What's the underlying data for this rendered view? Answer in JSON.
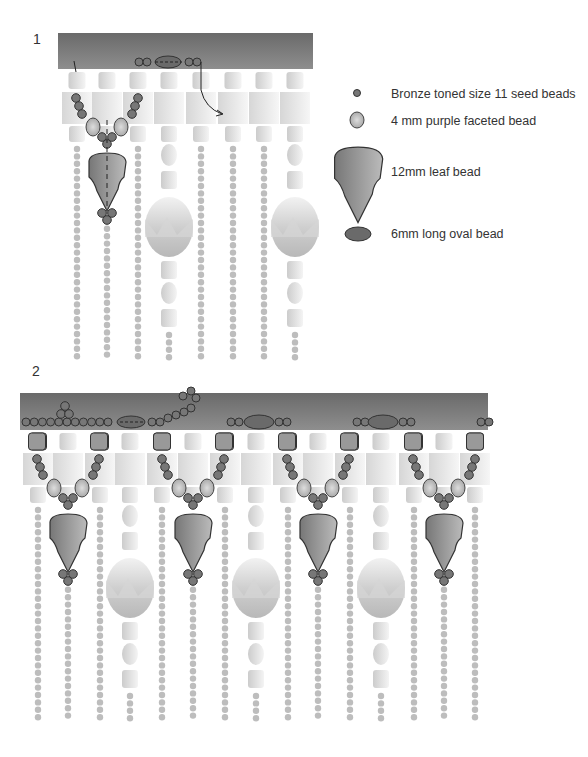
{
  "steps": [
    {
      "number": "1"
    },
    {
      "number": "2"
    }
  ],
  "legend": [
    {
      "icon": "seed-bead-icon",
      "label": "Bronze toned size 11 seed beads"
    },
    {
      "icon": "faceted-bead-icon",
      "label": "4 mm purple faceted bead"
    },
    {
      "icon": "leaf-bead-icon",
      "label": "12mm leaf bead"
    },
    {
      "icon": "oval-bead-icon",
      "label": "6mm long oval bead"
    }
  ],
  "colors": {
    "band_top": "#6e6e6e",
    "band_bottom": "#8a8a8a",
    "seed": "#777777",
    "faceted": "#c4c4c4",
    "leaf": "#8c8c8c",
    "oval": "#6a6a6a",
    "fringe_seed": "#bdbdbd",
    "ghost": "#dcdcdc"
  },
  "panel1": {
    "band": {
      "x": 58,
      "y": 33,
      "w": 255,
      "h": 36
    },
    "columns": [
      77,
      107,
      138,
      169,
      201,
      233,
      264,
      295
    ],
    "oval_columns": [
      169,
      295
    ],
    "leaf_column": 107
  },
  "panel2": {
    "band": {
      "x": 20,
      "y": 393,
      "w": 468,
      "h": 37
    },
    "columns": [
      38,
      68,
      100,
      130,
      162,
      193,
      225,
      256,
      288,
      318,
      350,
      381,
      414,
      444,
      475
    ],
    "leaf_columns": [
      68,
      193,
      318,
      444
    ],
    "oval_columns": [
      130,
      256,
      381
    ]
  }
}
